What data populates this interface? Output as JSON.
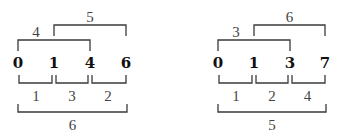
{
  "diagrams": [
    {
      "points": [
        {
          "label": "0",
          "x": 18
        },
        {
          "label": "1",
          "x": 54
        },
        {
          "label": "4",
          "x": 90
        },
        {
          "label": "6",
          "x": 126
        }
      ],
      "top_brackets": [
        {
          "label": "4",
          "from": 0,
          "to": 2,
          "level": 2
        },
        {
          "label": "5",
          "from": 1,
          "to": 3,
          "level": 1
        }
      ],
      "gaps": [
        {
          "label": "1",
          "from": 0,
          "to": 1
        },
        {
          "label": "3",
          "from": 1,
          "to": 2
        },
        {
          "label": "2",
          "from": 2,
          "to": 3
        }
      ],
      "total": {
        "label": "6",
        "from": 0,
        "to": 3
      }
    },
    {
      "points": [
        {
          "label": "0",
          "x": 218
        },
        {
          "label": "1",
          "x": 254
        },
        {
          "label": "3",
          "x": 290
        },
        {
          "label": "7",
          "x": 325
        }
      ],
      "top_brackets": [
        {
          "label": "3",
          "from": 0,
          "to": 2,
          "level": 2
        },
        {
          "label": "6",
          "from": 1,
          "to": 3,
          "level": 1
        }
      ],
      "gaps": [
        {
          "label": "1",
          "from": 0,
          "to": 1
        },
        {
          "label": "2",
          "from": 1,
          "to": 2
        },
        {
          "label": "4",
          "from": 2,
          "to": 3
        }
      ],
      "total": {
        "label": "5",
        "from": 0,
        "to": 3
      }
    }
  ]
}
